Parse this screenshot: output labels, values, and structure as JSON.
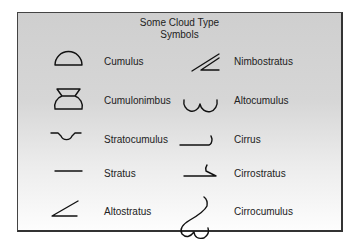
{
  "title_line1": "Some Cloud Type",
  "title_line2": "Symbols",
  "symbols": [
    {
      "name": "Cumulus",
      "icon": "cumulus-icon"
    },
    {
      "name": "Cumulonimbus",
      "icon": "cumulonimbus-icon"
    },
    {
      "name": "Stratocumulus",
      "icon": "stratocumulus-icon"
    },
    {
      "name": "Stratus",
      "icon": "stratus-icon"
    },
    {
      "name": "Altostratus",
      "icon": "altostratus-icon"
    },
    {
      "name": "Nimbostratus",
      "icon": "nimbostratus-icon"
    },
    {
      "name": "Altocumulus",
      "icon": "altocumulus-icon"
    },
    {
      "name": "Cirrus",
      "icon": "cirrus-icon"
    },
    {
      "name": "Cirrostratus",
      "icon": "cirrostratus-icon"
    },
    {
      "name": "Cirrocumulus",
      "icon": "cirrocumulus-icon"
    }
  ]
}
